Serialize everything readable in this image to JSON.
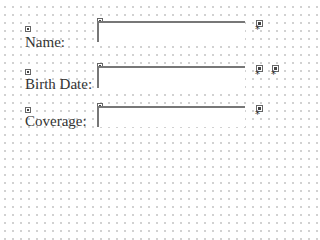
{
  "form": {
    "fields": [
      {
        "label": "Name:",
        "value": "",
        "required_marker": "*"
      },
      {
        "label": "Birth Date:",
        "value": "",
        "required_marker": "*",
        "extra_marker": "*"
      },
      {
        "label": "Coverage:",
        "value": "",
        "required_marker": "*"
      }
    ]
  }
}
